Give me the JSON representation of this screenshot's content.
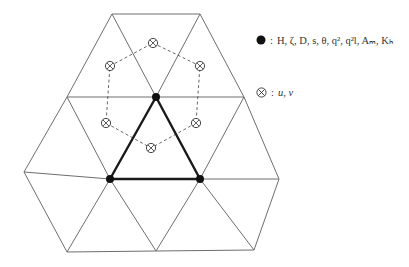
{
  "diagram": {
    "type": "unstructured triangular grid with staggered variable placement",
    "colors": {
      "mesh_line": "#6e6e6e",
      "highlight_line": "#1a1a1a",
      "node": "#111111",
      "dashed": "#555555"
    },
    "nodes": {
      "A": [
        112,
        14
      ],
      "B": [
        200,
        14
      ],
      "C": [
        67,
        97
      ],
      "D": [
        156,
        97
      ],
      "E": [
        244,
        97
      ],
      "F": [
        24,
        172
      ],
      "G": [
        110,
        179
      ],
      "H": [
        200,
        179
      ],
      "I": [
        279,
        179
      ],
      "J": [
        67,
        252
      ],
      "K": [
        156,
        251
      ],
      "L": [
        254,
        250
      ]
    },
    "edges": [
      [
        "A",
        "B"
      ],
      [
        "A",
        "C"
      ],
      [
        "A",
        "D"
      ],
      [
        "B",
        "D"
      ],
      [
        "B",
        "E"
      ],
      [
        "C",
        "D"
      ],
      [
        "D",
        "E"
      ],
      [
        "C",
        "F"
      ],
      [
        "C",
        "G"
      ],
      [
        "D",
        "G"
      ],
      [
        "D",
        "H"
      ],
      [
        "E",
        "H"
      ],
      [
        "E",
        "I"
      ],
      [
        "F",
        "G"
      ],
      [
        "G",
        "H"
      ],
      [
        "H",
        "I"
      ],
      [
        "F",
        "J"
      ],
      [
        "G",
        "J"
      ],
      [
        "G",
        "K"
      ],
      [
        "H",
        "K"
      ],
      [
        "H",
        "L"
      ],
      [
        "I",
        "L"
      ],
      [
        "J",
        "K"
      ],
      [
        "K",
        "L"
      ]
    ],
    "highlight_triangle": [
      "D",
      "G",
      "H"
    ],
    "scalar_nodes": [
      "D",
      "G",
      "H"
    ],
    "velocity_points": [
      [
        153,
        43
      ],
      [
        200,
        66
      ],
      [
        196,
        123
      ],
      [
        151,
        148
      ],
      [
        106,
        123
      ],
      [
        110,
        66
      ]
    ]
  },
  "legend": {
    "scalar": {
      "symbol": "filled-circle",
      "separator": ":",
      "variables": "H, ζ, D, s, θ, q², q²l, Aₘ, Kₕ"
    },
    "velocity": {
      "symbol": "circled-cross",
      "separator": ":",
      "variables": "u, v"
    }
  }
}
